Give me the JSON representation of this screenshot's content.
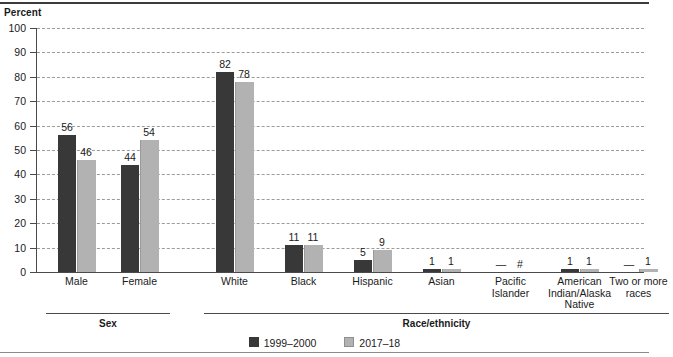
{
  "figure": {
    "y_axis_title": "Percent",
    "group_brackets": [
      {
        "label": "Sex",
        "start_index": 0,
        "end_index": 1
      },
      {
        "label": "Race/ethnicity",
        "start_index": 2,
        "end_index": 8
      }
    ]
  },
  "legend": {
    "items": [
      {
        "label": "1999–2000",
        "color": "#383838",
        "swatch": "series-1-swatch"
      },
      {
        "label": "2017–18",
        "color": "#b2b2b2",
        "swatch": "series-2-swatch"
      }
    ]
  },
  "chart_data": {
    "type": "bar",
    "title": "",
    "xlabel": "",
    "ylabel": "Percent",
    "ylim": [
      0,
      100
    ],
    "yticks": [
      0,
      10,
      20,
      30,
      40,
      50,
      60,
      70,
      80,
      90,
      100
    ],
    "ytick_labels": [
      "0",
      "10",
      "20",
      "30",
      "40",
      "50",
      "60",
      "70",
      "80",
      "90",
      "100"
    ],
    "grid": true,
    "legend_position": "bottom-center",
    "categories": [
      "Male",
      "Female",
      "White",
      "Black",
      "Hispanic",
      "Asian",
      "Pacific Islander",
      "American Indian/Alaska Native",
      "Two or more races"
    ],
    "category_display": [
      "Male",
      "Female",
      "White",
      "Black",
      "Hispanic",
      "Asian",
      "Pacific\nIslander",
      "American\nIndian/Alaska\nNative",
      "Two or more\nraces"
    ],
    "series": [
      {
        "name": "1999–2000",
        "color": "#383838",
        "values": [
          56,
          44,
          82,
          11,
          5,
          1,
          0,
          1,
          0
        ],
        "labels": [
          "56",
          "44",
          "82",
          "11",
          "5",
          "1",
          "—",
          "1",
          "—"
        ]
      },
      {
        "name": "2017–18",
        "color": "#b2b2b2",
        "values": [
          46,
          54,
          78,
          11,
          9,
          1,
          0,
          1,
          1
        ],
        "labels": [
          "46",
          "54",
          "78",
          "11",
          "9",
          "1",
          "#",
          "1",
          "1"
        ]
      }
    ],
    "annotations": [
      "— Not available.",
      "# Rounds to zero."
    ]
  }
}
